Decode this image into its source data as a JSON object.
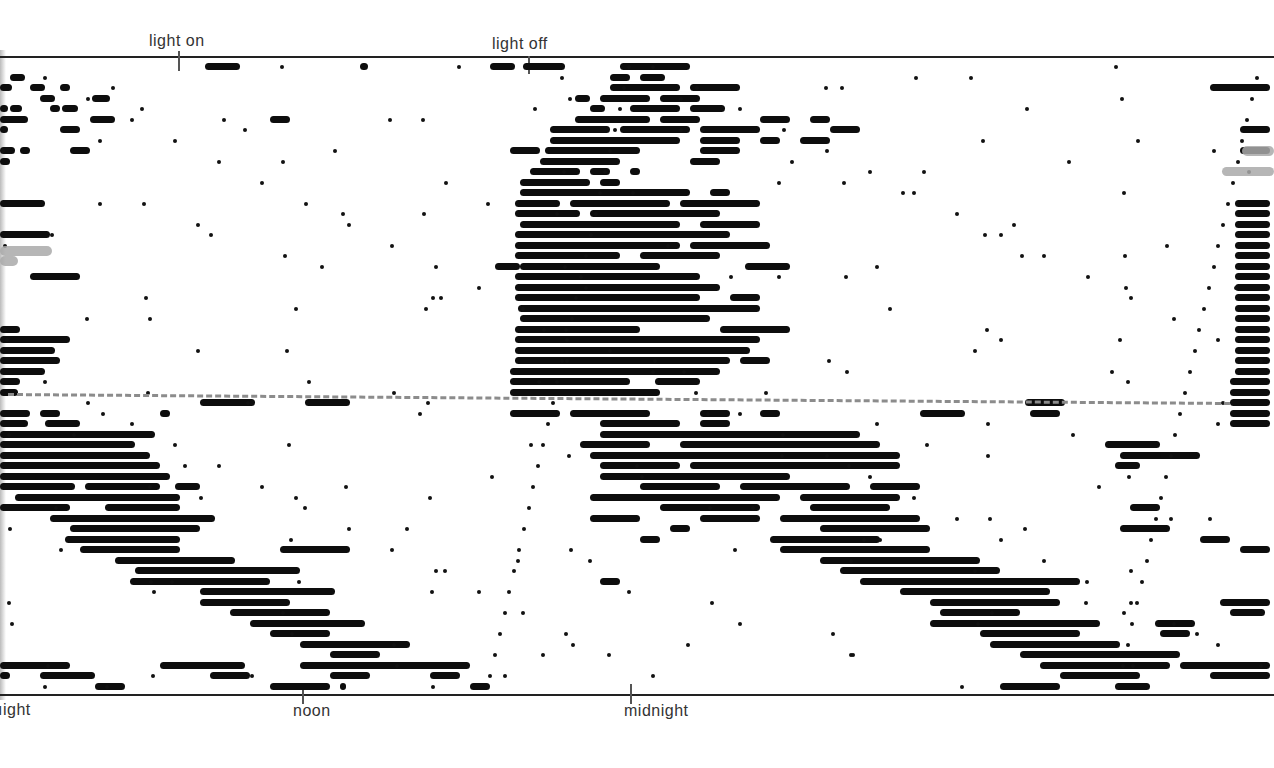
{
  "chart_data": {
    "type": "actogram",
    "title": "",
    "top_labels": [
      {
        "text": "light on",
        "x": 180
      },
      {
        "text": "light off",
        "x": 529
      }
    ],
    "bottom_labels": [
      {
        "text": "night",
        "x": 0,
        "display": "ıight"
      },
      {
        "text": "noon",
        "x": 303
      },
      {
        "text": "midnight",
        "x": 631
      }
    ],
    "xlabel": "time of day (double-plotted)",
    "ylabel": "successive days",
    "rows_count": 60,
    "row_spacing_px": 10.5,
    "reference_line": {
      "style": "dashed",
      "color": "#8c8c8c",
      "y_start": 393,
      "y_end": 402,
      "meaning": "change of condition"
    },
    "phases": [
      {
        "name": "entrained (LD)",
        "rows": "1-32",
        "activity": "nocturnal block between light off and light on"
      },
      {
        "name": "free-running",
        "rows": "33-60",
        "activity": "onset drifts later each day (period > 24h)"
      }
    ],
    "activity_rows": [
      [
        [
          205,
          240
        ],
        [
          360,
          368
        ],
        [
          490,
          515
        ],
        [
          523,
          565
        ],
        [
          620,
          690
        ]
      ],
      [
        [
          10,
          25
        ],
        [
          610,
          630
        ],
        [
          640,
          665
        ]
      ],
      [
        [
          0,
          12
        ],
        [
          30,
          45
        ],
        [
          60,
          70
        ],
        [
          610,
          680
        ],
        [
          690,
          740
        ],
        [
          1210,
          1270
        ]
      ],
      [
        [
          40,
          55
        ],
        [
          92,
          110
        ],
        [
          575,
          590
        ],
        [
          600,
          650
        ],
        [
          660,
          700
        ]
      ],
      [
        [
          0,
          8
        ],
        [
          10,
          22
        ],
        [
          50,
          60
        ],
        [
          62,
          78
        ],
        [
          590,
          605
        ],
        [
          630,
          680
        ],
        [
          690,
          725
        ]
      ],
      [
        [
          0,
          28
        ],
        [
          90,
          115
        ],
        [
          270,
          290
        ],
        [
          575,
          650
        ],
        [
          660,
          700
        ],
        [
          760,
          790
        ],
        [
          810,
          830
        ]
      ],
      [
        [
          0,
          8
        ],
        [
          60,
          80
        ],
        [
          550,
          610
        ],
        [
          620,
          690
        ],
        [
          700,
          760
        ],
        [
          830,
          860
        ],
        [
          1240,
          1270
        ]
      ],
      [
        [
          550,
          680
        ],
        [
          700,
          740
        ],
        [
          760,
          780
        ],
        [
          800,
          830
        ]
      ],
      [
        [
          0,
          15
        ],
        [
          20,
          30
        ],
        [
          70,
          90
        ],
        [
          510,
          540
        ],
        [
          545,
          640
        ],
        [
          700,
          740
        ],
        [
          1240,
          1270
        ]
      ],
      [
        [
          0,
          10
        ],
        [
          540,
          620
        ],
        [
          690,
          720
        ]
      ],
      [
        [
          530,
          580
        ],
        [
          590,
          610
        ],
        [
          630,
          640
        ]
      ],
      [
        [
          520,
          590
        ],
        [
          600,
          620
        ]
      ],
      [
        [
          520,
          690
        ],
        [
          710,
          730
        ]
      ],
      [
        [
          0,
          45
        ],
        [
          515,
          560
        ],
        [
          570,
          670
        ],
        [
          680,
          760
        ],
        [
          1235,
          1270
        ]
      ],
      [
        [
          515,
          580
        ],
        [
          590,
          720
        ],
        [
          1235,
          1270
        ]
      ],
      [
        [
          520,
          680
        ],
        [
          700,
          760
        ],
        [
          1235,
          1270
        ]
      ],
      [
        [
          0,
          50
        ],
        [
          515,
          730
        ],
        [
          1235,
          1270
        ]
      ],
      [
        [
          515,
          680
        ],
        [
          690,
          770
        ],
        [
          1235,
          1270
        ]
      ],
      [
        [
          515,
          620
        ],
        [
          640,
          720
        ],
        [
          1235,
          1270
        ]
      ],
      [
        [
          495,
          520
        ],
        [
          520,
          660
        ],
        [
          745,
          790
        ],
        [
          1235,
          1270
        ]
      ],
      [
        [
          30,
          80
        ],
        [
          515,
          700
        ],
        [
          1235,
          1270
        ]
      ],
      [
        [
          515,
          720
        ],
        [
          1235,
          1270
        ]
      ],
      [
        [
          515,
          700
        ],
        [
          730,
          760
        ],
        [
          1235,
          1270
        ]
      ],
      [
        [
          518,
          760
        ],
        [
          1235,
          1270
        ]
      ],
      [
        [
          520,
          710
        ],
        [
          1235,
          1270
        ]
      ],
      [
        [
          0,
          20
        ],
        [
          515,
          640
        ],
        [
          720,
          790
        ],
        [
          1235,
          1270
        ]
      ],
      [
        [
          0,
          70
        ],
        [
          515,
          760
        ],
        [
          1235,
          1270
        ]
      ],
      [
        [
          0,
          55
        ],
        [
          515,
          750
        ],
        [
          1235,
          1270
        ]
      ],
      [
        [
          0,
          60
        ],
        [
          515,
          730
        ],
        [
          740,
          770
        ],
        [
          1235,
          1270
        ]
      ],
      [
        [
          0,
          45
        ],
        [
          510,
          720
        ],
        [
          1235,
          1270
        ]
      ],
      [
        [
          0,
          20
        ],
        [
          510,
          630
        ],
        [
          655,
          700
        ],
        [
          1230,
          1270
        ]
      ],
      [
        [
          0,
          18
        ],
        [
          510,
          660
        ],
        [
          1230,
          1270
        ]
      ],
      [
        [
          200,
          255
        ],
        [
          305,
          350
        ],
        [
          1025,
          1065
        ],
        [
          1230,
          1270
        ]
      ],
      [
        [
          0,
          30
        ],
        [
          40,
          60
        ],
        [
          160,
          170
        ],
        [
          510,
          560
        ],
        [
          570,
          650
        ],
        [
          700,
          730
        ],
        [
          760,
          780
        ],
        [
          920,
          965
        ],
        [
          1030,
          1060
        ],
        [
          1230,
          1270
        ]
      ],
      [
        [
          0,
          28
        ],
        [
          45,
          80
        ],
        [
          600,
          680
        ],
        [
          700,
          730
        ],
        [
          1230,
          1270
        ]
      ],
      [
        [
          0,
          155
        ],
        [
          600,
          860
        ]
      ],
      [
        [
          0,
          135
        ],
        [
          580,
          650
        ],
        [
          680,
          880
        ],
        [
          1105,
          1160
        ]
      ],
      [
        [
          0,
          150
        ],
        [
          590,
          900
        ],
        [
          1120,
          1200
        ],
        [
          1160,
          1190
        ]
      ],
      [
        [
          0,
          160
        ],
        [
          600,
          680
        ],
        [
          690,
          900
        ],
        [
          1115,
          1140
        ]
      ],
      [
        [
          0,
          170
        ],
        [
          35,
          100
        ],
        [
          600,
          790
        ]
      ],
      [
        [
          0,
          75
        ],
        [
          85,
          160
        ],
        [
          175,
          200
        ],
        [
          640,
          720
        ],
        [
          740,
          850
        ],
        [
          870,
          920
        ]
      ],
      [
        [
          15,
          180
        ],
        [
          590,
          780
        ],
        [
          800,
          900
        ]
      ],
      [
        [
          0,
          70
        ],
        [
          105,
          180
        ],
        [
          660,
          760
        ],
        [
          810,
          890
        ],
        [
          1130,
          1160
        ]
      ],
      [
        [
          50,
          215
        ],
        [
          590,
          640
        ],
        [
          700,
          760
        ],
        [
          780,
          920
        ]
      ],
      [
        [
          70,
          200
        ],
        [
          670,
          690
        ],
        [
          820,
          930
        ],
        [
          1120,
          1170
        ]
      ],
      [
        [
          65,
          180
        ],
        [
          640,
          660
        ],
        [
          770,
          880
        ],
        [
          1200,
          1230
        ]
      ],
      [
        [
          80,
          180
        ],
        [
          280,
          350
        ],
        [
          780,
          930
        ],
        [
          1240,
          1270
        ]
      ],
      [
        [
          115,
          235
        ],
        [
          820,
          980
        ]
      ],
      [
        [
          135,
          300
        ],
        [
          840,
          1000
        ]
      ],
      [
        [
          130,
          270
        ],
        [
          600,
          620
        ],
        [
          860,
          1080
        ]
      ],
      [
        [
          200,
          335
        ],
        [
          900,
          1050
        ]
      ],
      [
        [
          200,
          290
        ],
        [
          930,
          1060
        ],
        [
          1220,
          1270
        ]
      ],
      [
        [
          230,
          330
        ],
        [
          940,
          1020
        ],
        [
          1230,
          1265
        ]
      ],
      [
        [
          250,
          365
        ],
        [
          930,
          1100
        ],
        [
          1155,
          1195
        ]
      ],
      [
        [
          270,
          330
        ],
        [
          980,
          1080
        ],
        [
          1160,
          1190
        ]
      ],
      [
        [
          300,
          410
        ],
        [
          990,
          1120
        ]
      ],
      [
        [
          330,
          380
        ],
        [
          1020,
          1180
        ]
      ],
      [
        [
          0,
          70
        ],
        [
          160,
          245
        ],
        [
          300,
          470
        ],
        [
          1040,
          1170
        ],
        [
          1180,
          1270
        ]
      ],
      [
        [
          0,
          10
        ],
        [
          40,
          95
        ],
        [
          210,
          250
        ],
        [
          330,
          370
        ],
        [
          430,
          460
        ],
        [
          1060,
          1140
        ],
        [
          1210,
          1270
        ]
      ],
      [
        [
          95,
          125
        ],
        [
          270,
          330
        ],
        [
          340,
          345
        ],
        [
          470,
          490
        ],
        [
          1000,
          1060
        ],
        [
          1115,
          1150
        ]
      ]
    ]
  },
  "figure": {
    "frame_color": "#222222",
    "ink_color": "#0d0d0d",
    "background": "#ffffff"
  }
}
